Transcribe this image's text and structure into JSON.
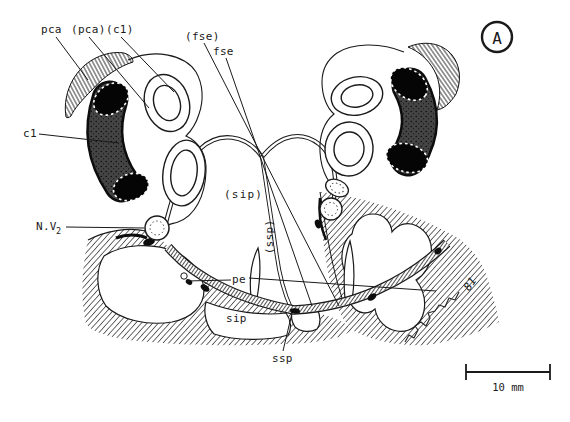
{
  "figure": {
    "panel_letter": "A",
    "scale_bar": {
      "label": "10 mm"
    },
    "signature": "81",
    "labels": {
      "pca": "pca",
      "pca_paren": "(pca)",
      "c1_paren": "(c1)",
      "fse_paren": "(fse)",
      "fse": "fse",
      "c1": "c1",
      "nv2_main": "N.V",
      "nv2_sub": "2",
      "sip_paren": "(sip)",
      "ssp_paren": "(ssp)",
      "pe": "pe",
      "sip": "sip",
      "ssp": "ssp"
    },
    "colors": {
      "ink": "#1a1a1a",
      "paper": "#ffffff"
    }
  }
}
